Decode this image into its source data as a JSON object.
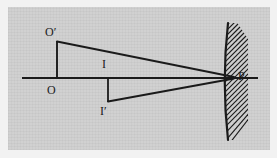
{
  "figure": {
    "background_color": "#f2f2f2",
    "panel_color": "#cfcfcf",
    "ink_color": "#1a1a1a"
  },
  "labels": {
    "object_base": "O",
    "object_tip": "O′",
    "image_base": "I",
    "image_tip": "I′",
    "mirror_vertex": "P"
  },
  "elements": {
    "principal_axis": "principal-axis",
    "object_arrow": "object-segment-OO-prime",
    "image_arrow": "image-segment-II-prime",
    "ray_top": "ray-from-O-prime-to-P",
    "ray_bottom": "ray-from-P-to-I-prime",
    "mirror": "concave-mirror-arc",
    "mirror_hatching": "mirror-back-hatching"
  },
  "geometry": {
    "axis_y": 78,
    "axis_x_start": 22,
    "axis_x_end": 258,
    "O_x": 57,
    "O_y": 78,
    "O_prime_x": 57,
    "O_prime_y": 41,
    "I_x": 108,
    "I_y": 78,
    "I_prime_x": 108,
    "I_prime_y": 102,
    "P_x": 233,
    "P_y": 78,
    "mirror_top_x": 228,
    "mirror_top_y": 23,
    "mirror_bottom_x": 228,
    "mirror_bottom_y": 140,
    "mirror_bulge_x": 222,
    "hatch_count": 22
  }
}
